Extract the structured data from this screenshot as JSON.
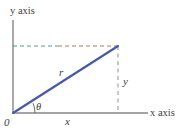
{
  "figure": {
    "labels": {
      "y_axis": "y axis",
      "x_axis": "x axis",
      "origin": "0",
      "radius": "r",
      "y_component": "y",
      "x_component": "x",
      "angle": "θ"
    },
    "colors": {
      "ray": "#4457b4",
      "axis": "#808080",
      "dashed_vertical": "#9a9a9a",
      "dashed_horizontal_left": "#2f8f82",
      "dashed_horizontal_right": "#b05a4e",
      "text": "#3d3d3d",
      "background": "#ffffff"
    },
    "geometry": {
      "origin_px": [
        13,
        113
      ],
      "point_px": [
        118,
        46
      ],
      "y_axis_top_px": [
        13,
        20
      ],
      "x_axis_right_px": [
        148,
        113
      ],
      "angle_arc_radius_px": 22
    }
  }
}
